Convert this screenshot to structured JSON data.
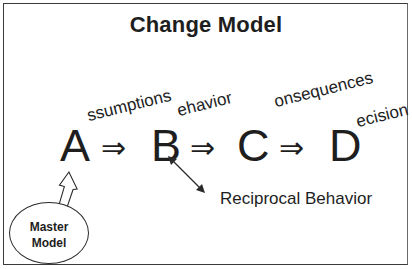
{
  "diagram": {
    "title": "Change Model",
    "chain": [
      {
        "letter": "A",
        "suffix": "ssumptions"
      },
      {
        "letter": "B",
        "suffix": "ehavior"
      },
      {
        "letter": "C",
        "suffix": "onsequences"
      },
      {
        "letter": "D",
        "suffix": "ecision"
      }
    ],
    "implies_symbol": "⇒",
    "master_model": {
      "line1": "Master",
      "line2": "Model"
    },
    "reciprocal_label": "Reciprocal Behavior"
  },
  "colors": {
    "ink": "#1e1e1e",
    "border": "#3a3a3a",
    "background": "#ffffff"
  }
}
